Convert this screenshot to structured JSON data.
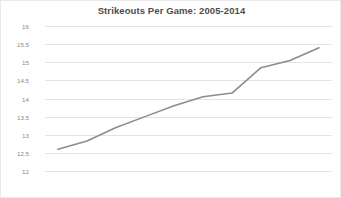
{
  "chart_data": {
    "type": "line",
    "title": "Strikeouts Per Game: 2005-2014",
    "xlabel": "",
    "ylabel": "",
    "categories": [
      "2005",
      "2006",
      "2007",
      "2008",
      "2009",
      "2010",
      "2011",
      "2012",
      "2013",
      "2014"
    ],
    "values": [
      12.6,
      12.83,
      13.2,
      13.5,
      13.8,
      14.05,
      14.15,
      14.85,
      15.05,
      15.4
    ],
    "series": [
      {
        "name": "Strikeouts Per Game",
        "values": [
          12.6,
          12.83,
          13.2,
          13.5,
          13.8,
          14.05,
          14.15,
          14.85,
          15.05,
          15.4
        ]
      }
    ],
    "ylim": [
      12,
      16
    ],
    "ytick_labels": [
      "16",
      "15.5",
      "15",
      "14.5",
      "14",
      "13.5",
      "13",
      "12.5",
      "12"
    ],
    "ytick_values": [
      16,
      15.5,
      15,
      14.5,
      14,
      13.5,
      13,
      12.5,
      12
    ],
    "grid": true,
    "legend": false,
    "line_color": "#8c8c8c",
    "grid_color": "#e4e4e4",
    "title_color": "#4d4d4d",
    "tick_color": "#888888",
    "background_color": "#ffffff",
    "markers": false
  }
}
